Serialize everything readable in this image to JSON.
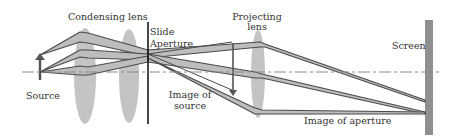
{
  "diagram": {
    "labels": {
      "condensing_lens": "Condensing lens",
      "slide": "Slide",
      "aperture": "Aperture",
      "projecting_lens_line1": "Projecting",
      "projecting_lens_line2": "lens",
      "screen": "Screen",
      "source": "Source",
      "image_of_source_line1": "Image of",
      "image_of_source_line2": "source",
      "image_of_aperture": "Image of aperture"
    },
    "colors": {
      "lens_fill": "#c4c4c4",
      "beam_fill": "#bdbdbd",
      "ray_stroke": "#4a4a4a",
      "axis_dash": "#8a8a8a",
      "screen_fill": "#8f8f8f",
      "slide_line": "#1a1a1a"
    }
  }
}
